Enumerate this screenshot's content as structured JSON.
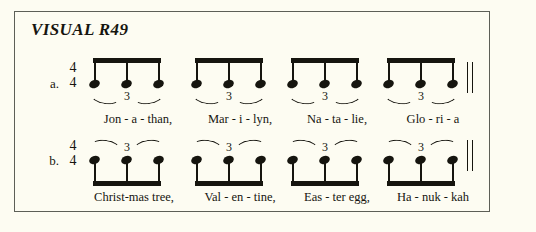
{
  "page": {
    "background_color": "#fdfcf2",
    "border_color": "#5d5f57",
    "ink_color": "#16150f"
  },
  "title": "VISUAL R49",
  "exercises": [
    {
      "id": "a",
      "label": "a.",
      "time_signature": {
        "beats": "4",
        "unit": "4"
      },
      "stem_direction": "down",
      "beam_position": "above",
      "triplet_bracket_position": "below",
      "barline": "double",
      "groups": [
        {
          "triplet_number": "3",
          "notes": 3,
          "lyric": "Jon - a - than,"
        },
        {
          "triplet_number": "3",
          "notes": 3,
          "lyric": "Mar - i - lyn,"
        },
        {
          "triplet_number": "3",
          "notes": 3,
          "lyric": "Na - ta - lie,"
        },
        {
          "triplet_number": "3",
          "notes": 3,
          "lyric": "Glo - ri - a"
        }
      ]
    },
    {
      "id": "b",
      "label": "b.",
      "time_signature": {
        "beats": "4",
        "unit": "4"
      },
      "stem_direction": "up",
      "beam_position": "below",
      "triplet_bracket_position": "above",
      "barline": "double",
      "groups": [
        {
          "triplet_number": "3",
          "notes": 3,
          "lyric": "Christ-mas tree,"
        },
        {
          "triplet_number": "3",
          "notes": 3,
          "lyric": "Val - en - tine,"
        },
        {
          "triplet_number": "3",
          "notes": 3,
          "lyric": "Eas - ter egg,"
        },
        {
          "triplet_number": "3",
          "notes": 3,
          "lyric": "Ha - nuk - kah"
        }
      ]
    }
  ]
}
